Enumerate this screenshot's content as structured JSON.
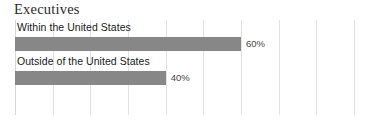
{
  "chart_data": {
    "type": "bar",
    "orientation": "horizontal",
    "title": "Executives",
    "xlabel": "",
    "ylabel": "",
    "categories": [
      "Within the United States",
      "Outside of the United States"
    ],
    "values": [
      60,
      40
    ],
    "value_labels": [
      "60%",
      "40%"
    ],
    "units": "percent",
    "xlim": [
      0,
      90
    ],
    "xtick_step": 10,
    "grid": true,
    "grid_axis": "x",
    "xtick_labels_visible": false,
    "legend": false,
    "legend_position": "none",
    "bars": [
      {
        "label": "Within the United States",
        "value": 60,
        "value_label": "60%"
      },
      {
        "label": "Outside of the United States",
        "value": 40,
        "value_label": "40%"
      }
    ],
    "gridline_percents": [
      0,
      10,
      20,
      30,
      40,
      50,
      60,
      70,
      80,
      90
    ]
  },
  "colors": {
    "bar_fill": "#878787",
    "gridline": "#e2e2e2",
    "axis_line": "#d6d6d6",
    "title_text": "#2b2b2b",
    "label_text": "#1a1a1a",
    "value_text": "#454545",
    "background": "#ffffff"
  }
}
